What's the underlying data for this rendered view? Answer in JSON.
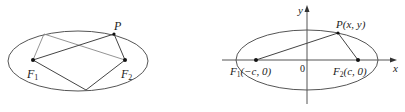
{
  "figures": [
    {
      "id": "left",
      "description": "Ellipse with foci F1, F2 and two points on the ellipse connected to the foci",
      "labels": {
        "P": "P",
        "F1_base": "F",
        "F1_sub": "1",
        "F2_base": "F",
        "F2_sub": "2"
      }
    },
    {
      "id": "right",
      "description": "Ellipse centered at origin on coordinate axes with foci on x-axis",
      "labels": {
        "y_axis": "y",
        "x_axis": "x",
        "origin": "0",
        "P": "P(x, y)",
        "F1_base": "F",
        "F1_sub": "1",
        "F1_coords": "(−c, 0)",
        "F2_base": "F",
        "F2_sub": "2",
        "F2_coords": "(c, 0)"
      }
    }
  ],
  "colors": {
    "stroke": "#555555",
    "dark_stroke": "#333333",
    "light_stroke": "#888888"
  }
}
